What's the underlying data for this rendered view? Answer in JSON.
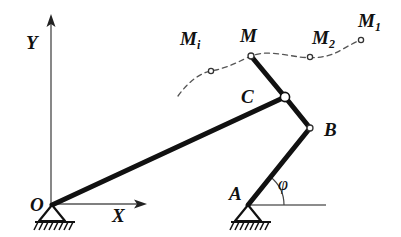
{
  "figure": {
    "background_color": "#ffffff",
    "ink_color": "#111111"
  },
  "axes": {
    "y_label": "Y",
    "x_label": "X",
    "origin_label": "O",
    "y_axis": {
      "x": 51,
      "y_top": 17,
      "y_bottom": 205
    },
    "x_axis": {
      "y": 204,
      "x_left": 51,
      "x_right": 145
    }
  },
  "labels": {
    "point_o": "O",
    "point_a": "A",
    "point_b": "B",
    "point_c": "C",
    "point_m": "M",
    "point_mi_base": "M",
    "point_mi_sub": "i",
    "point_m2_base": "M",
    "point_m2_sub": "2",
    "point_m1_base": "M",
    "point_m1_sub": "1",
    "angle_phi": "φ"
  },
  "label_positions": {
    "o": {
      "x": 30,
      "y": 211
    },
    "a": {
      "x": 229,
      "y": 200
    },
    "b": {
      "x": 324,
      "y": 136
    },
    "c": {
      "x": 241,
      "y": 103
    },
    "m": {
      "x": 240,
      "y": 42
    },
    "mi": {
      "x": 180,
      "y": 45
    },
    "m2": {
      "x": 312,
      "y": 44
    },
    "m1": {
      "x": 358,
      "y": 27
    },
    "phi": {
      "x": 278,
      "y": 190
    },
    "x": {
      "x": 112,
      "y": 222
    },
    "y": {
      "x": 26,
      "y": 49
    }
  },
  "joints": {
    "O": {
      "x": 52,
      "y": 205,
      "type": "fixed-pivot",
      "label": "O"
    },
    "A": {
      "x": 248,
      "y": 205,
      "type": "fixed-pivot",
      "label": "A"
    },
    "B": {
      "x": 310,
      "y": 128,
      "type": "pin-joint",
      "label": "B"
    },
    "C": {
      "x": 285,
      "y": 97,
      "type": "pin-joint",
      "label": "C"
    },
    "M": {
      "x": 251,
      "y": 56,
      "type": "coupler-point",
      "label": "M"
    }
  },
  "links": [
    {
      "name": "link-OC",
      "from": "O",
      "to": "C",
      "x1": 52,
      "y1": 205,
      "x2": 285,
      "y2": 97,
      "width": 5
    },
    {
      "name": "link-CM",
      "from": "C",
      "to": "M",
      "x1": 285,
      "y1": 97,
      "x2": 251,
      "y2": 56,
      "width": 5
    },
    {
      "name": "link-CB",
      "from": "C",
      "to": "B",
      "x1": 285,
      "y1": 97,
      "x2": 310,
      "y2": 128,
      "width": 5
    },
    {
      "name": "link-BA",
      "from": "B",
      "to": "A",
      "x1": 310,
      "y1": 128,
      "x2": 248,
      "y2": 205,
      "width": 5
    }
  ],
  "trajectory": {
    "name": "coupler-curve",
    "style": "dashed",
    "path": "M 178,96 C 188,82 200,73 211,71 C 228,68 242,60 251,56 C 266,50 284,55 300,57 C 316,59 330,57 343,49 C 352,44 357,41 361,40",
    "markers": [
      {
        "label": "M_i",
        "x": 211,
        "y": 71
      },
      {
        "label": "M",
        "x": 251,
        "y": 56
      },
      {
        "label": "M_2",
        "x": 310,
        "y": 57
      },
      {
        "label": "M_1",
        "x": 361,
        "y": 40
      }
    ]
  },
  "angle": {
    "symbol": "φ",
    "vertex": "A",
    "from_ray": "horizontal-reference",
    "to_ray": "link-AB",
    "arc_radius": 36,
    "reference_line": {
      "x1": 248,
      "y1": 205,
      "x2": 326,
      "y2": 205
    }
  },
  "supports": [
    {
      "name": "support-O",
      "apex_x": 52,
      "apex_y": 205,
      "base_y": 221,
      "half_width": 13,
      "hatch_count": 8,
      "hatch_x1": 35,
      "hatch_x2": 75
    },
    {
      "name": "support-A",
      "apex_x": 248,
      "apex_y": 205,
      "base_y": 221,
      "half_width": 13,
      "hatch_count": 8,
      "hatch_x1": 231,
      "hatch_x2": 271
    }
  ]
}
